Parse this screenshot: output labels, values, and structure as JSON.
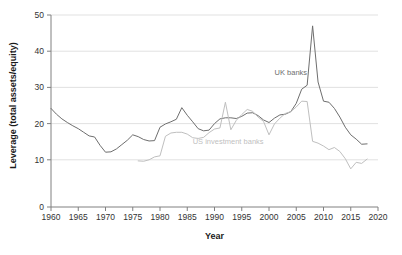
{
  "chart_data": {
    "type": "line",
    "title": "",
    "xlabel": "Year",
    "ylabel": "Leverage (total assets/equity)",
    "xlim": [
      1960,
      2020
    ],
    "ylim": [
      0,
      50
    ],
    "xticks": [
      1960,
      1965,
      1970,
      1975,
      1980,
      1985,
      1990,
      1995,
      2000,
      2005,
      2010,
      2015,
      2020
    ],
    "yticks": [
      0,
      10,
      20,
      30,
      40,
      50
    ],
    "grid": "horizontal",
    "legend_position": "inline-annotations",
    "series": [
      {
        "name": "UK banks",
        "color": "#6e6e6e",
        "label_x": 2004,
        "label_y": 33.5,
        "x": [
          1960,
          1961,
          1962,
          1963,
          1964,
          1965,
          1966,
          1967,
          1968,
          1969,
          1970,
          1971,
          1972,
          1973,
          1974,
          1975,
          1976,
          1977,
          1978,
          1979,
          1980,
          1981,
          1982,
          1983,
          1984,
          1985,
          1986,
          1987,
          1988,
          1989,
          1990,
          1991,
          1992,
          1993,
          1994,
          1995,
          1996,
          1997,
          1998,
          1999,
          2000,
          2001,
          2002,
          2003,
          2004,
          2005,
          2006,
          2007,
          2008,
          2009,
          2010,
          2011,
          2012,
          2013,
          2014,
          2015,
          2016,
          2017,
          2018
        ],
        "y": [
          24.2,
          22.6,
          21.3,
          20.3,
          19.4,
          18.6,
          17.6,
          16.6,
          16.3,
          14.0,
          12.1,
          12.2,
          13.0,
          14.2,
          15.4,
          16.9,
          16.4,
          15.6,
          15.2,
          15.3,
          19.0,
          19.9,
          20.5,
          21.2,
          24.4,
          22.3,
          20.5,
          18.6,
          18.0,
          18.2,
          20.0,
          21.3,
          21.6,
          21.6,
          21.4,
          22.0,
          22.9,
          23.0,
          22.2,
          21.0,
          20.3,
          21.5,
          22.4,
          22.6,
          23.3,
          25.6,
          29.5,
          30.6,
          47.0,
          31.5,
          26.2,
          25.9,
          24.2,
          21.8,
          19.0,
          16.9,
          15.7,
          14.3,
          14.4
        ]
      },
      {
        "name": "US investment banks",
        "color": "#bfbfbf",
        "label_x": 1992.5,
        "label_y": 14.3,
        "x": [
          1976,
          1977,
          1978,
          1979,
          1980,
          1981,
          1982,
          1983,
          1984,
          1985,
          1986,
          1987,
          1988,
          1989,
          1990,
          1991,
          1992,
          1993,
          1994,
          1995,
          1996,
          1997,
          1998,
          1999,
          2000,
          2001,
          2002,
          2003,
          2004,
          2005,
          2006,
          2007,
          2008,
          2009,
          2010,
          2011,
          2012,
          2013,
          2014,
          2015,
          2016,
          2017,
          2018
        ],
        "y": [
          9.7,
          9.6,
          10.0,
          10.8,
          11.1,
          16.5,
          17.4,
          17.6,
          17.6,
          17.1,
          16.1,
          15.9,
          16.2,
          17.5,
          18.5,
          18.8,
          25.9,
          18.3,
          20.9,
          22.5,
          23.9,
          23.4,
          21.8,
          20.6,
          16.9,
          19.9,
          21.5,
          22.8,
          23.3,
          24.6,
          26.2,
          26.1,
          15.1,
          14.6,
          13.8,
          12.8,
          13.4,
          12.3,
          10.3,
          7.5,
          9.3,
          9.0,
          10.2
        ]
      }
    ]
  }
}
